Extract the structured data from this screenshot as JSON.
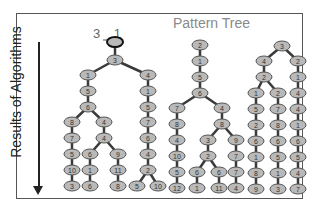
{
  "diagram": {
    "title": "Pattern Tree",
    "axis_label": "Results of Algorithms",
    "root_annotation": "3 1",
    "colors": {
      "node_fill": "#b9b9b9",
      "node_stroke": "#555555",
      "edge": "#3a3a3a",
      "title": "#8a8a8a",
      "frame": "#555555"
    },
    "trees": [
      {
        "name": "left-tree",
        "root": {
          "x": 115,
          "y": 42,
          "label": "",
          "highlight": true
        },
        "nodes": [
          {
            "id": "a0",
            "x": 115,
            "y": 42,
            "label": "",
            "hl": true
          },
          {
            "id": "a1",
            "x": 115,
            "y": 60,
            "label": "3"
          },
          {
            "id": "a2",
            "x": 88,
            "y": 75,
            "label": "1"
          },
          {
            "id": "a3",
            "x": 148,
            "y": 75,
            "label": "4"
          },
          {
            "id": "a4",
            "x": 88,
            "y": 91,
            "label": "5"
          },
          {
            "id": "a5",
            "x": 148,
            "y": 91,
            "label": "1"
          },
          {
            "id": "a6",
            "x": 88,
            "y": 107,
            "label": "6"
          },
          {
            "id": "a7",
            "x": 148,
            "y": 107,
            "label": "5"
          },
          {
            "id": "a8",
            "x": 72,
            "y": 122,
            "label": "8"
          },
          {
            "id": "a9",
            "x": 104,
            "y": 122,
            "label": "4"
          },
          {
            "id": "a10",
            "x": 148,
            "y": 122,
            "label": "7"
          },
          {
            "id": "a11",
            "x": 72,
            "y": 138,
            "label": "7"
          },
          {
            "id": "a12",
            "x": 104,
            "y": 138,
            "label": "4"
          },
          {
            "id": "a13",
            "x": 148,
            "y": 138,
            "label": "6"
          },
          {
            "id": "a14",
            "x": 72,
            "y": 154,
            "label": "5"
          },
          {
            "id": "a15",
            "x": 90,
            "y": 154,
            "label": "6"
          },
          {
            "id": "a16",
            "x": 118,
            "y": 154,
            "label": "9"
          },
          {
            "id": "a17",
            "x": 148,
            "y": 154,
            "label": "4"
          },
          {
            "id": "a18",
            "x": 72,
            "y": 170,
            "label": "10"
          },
          {
            "id": "a19",
            "x": 90,
            "y": 170,
            "label": "1"
          },
          {
            "id": "a20",
            "x": 118,
            "y": 170,
            "label": "11"
          },
          {
            "id": "a21",
            "x": 148,
            "y": 170,
            "label": "2"
          },
          {
            "id": "a22",
            "x": 72,
            "y": 186,
            "label": "3"
          },
          {
            "id": "a23",
            "x": 90,
            "y": 186,
            "label": "6"
          },
          {
            "id": "a24",
            "x": 118,
            "y": 186,
            "label": "8"
          },
          {
            "id": "a25",
            "x": 137,
            "y": 186,
            "label": "5"
          },
          {
            "id": "a26",
            "x": 158,
            "y": 186,
            "label": "10"
          }
        ],
        "edges": [
          [
            "a0",
            "a1"
          ],
          [
            "a1",
            "a2"
          ],
          [
            "a1",
            "a3"
          ],
          [
            "a2",
            "a4"
          ],
          [
            "a4",
            "a6"
          ],
          [
            "a6",
            "a8"
          ],
          [
            "a6",
            "a9"
          ],
          [
            "a8",
            "a11"
          ],
          [
            "a11",
            "a14"
          ],
          [
            "a14",
            "a18"
          ],
          [
            "a18",
            "a22"
          ],
          [
            "a9",
            "a12"
          ],
          [
            "a12",
            "a15"
          ],
          [
            "a12",
            "a16"
          ],
          [
            "a15",
            "a19"
          ],
          [
            "a19",
            "a23"
          ],
          [
            "a16",
            "a20"
          ],
          [
            "a20",
            "a24"
          ],
          [
            "a3",
            "a5"
          ],
          [
            "a5",
            "a7"
          ],
          [
            "a7",
            "a10"
          ],
          [
            "a10",
            "a13"
          ],
          [
            "a13",
            "a17"
          ],
          [
            "a17",
            "a21"
          ],
          [
            "a21",
            "a25"
          ],
          [
            "a21",
            "a26"
          ]
        ]
      },
      {
        "name": "middle-tree",
        "nodes": [
          {
            "id": "b0",
            "x": 200,
            "y": 45,
            "label": "2"
          },
          {
            "id": "b1",
            "x": 200,
            "y": 61,
            "label": "1"
          },
          {
            "id": "b2",
            "x": 200,
            "y": 77,
            "label": "5"
          },
          {
            "id": "b3",
            "x": 200,
            "y": 93,
            "label": "6"
          },
          {
            "id": "b4",
            "x": 177,
            "y": 108,
            "label": "7"
          },
          {
            "id": "b5",
            "x": 222,
            "y": 108,
            "label": "4"
          },
          {
            "id": "b6",
            "x": 177,
            "y": 124,
            "label": "8"
          },
          {
            "id": "b7",
            "x": 222,
            "y": 124,
            "label": "8"
          },
          {
            "id": "b8",
            "x": 177,
            "y": 140,
            "label": "4"
          },
          {
            "id": "b9",
            "x": 208,
            "y": 140,
            "label": "3"
          },
          {
            "id": "b10",
            "x": 236,
            "y": 140,
            "label": "9"
          },
          {
            "id": "b11",
            "x": 177,
            "y": 156,
            "label": "10"
          },
          {
            "id": "b12",
            "x": 208,
            "y": 156,
            "label": "2"
          },
          {
            "id": "b13",
            "x": 236,
            "y": 156,
            "label": "7"
          },
          {
            "id": "b14",
            "x": 177,
            "y": 172,
            "label": "5"
          },
          {
            "id": "b15",
            "x": 197,
            "y": 172,
            "label": "6"
          },
          {
            "id": "b16",
            "x": 219,
            "y": 172,
            "label": "6"
          },
          {
            "id": "b17",
            "x": 236,
            "y": 172,
            "label": "7"
          },
          {
            "id": "b18",
            "x": 177,
            "y": 188,
            "label": "12"
          },
          {
            "id": "b19",
            "x": 197,
            "y": 188,
            "label": "1"
          },
          {
            "id": "b20",
            "x": 219,
            "y": 188,
            "label": "11"
          },
          {
            "id": "b21",
            "x": 236,
            "y": 188,
            "label": "4"
          }
        ],
        "edges": [
          [
            "b0",
            "b1"
          ],
          [
            "b1",
            "b2"
          ],
          [
            "b2",
            "b3"
          ],
          [
            "b3",
            "b4"
          ],
          [
            "b3",
            "b5"
          ],
          [
            "b4",
            "b6"
          ],
          [
            "b6",
            "b8"
          ],
          [
            "b8",
            "b11"
          ],
          [
            "b11",
            "b14"
          ],
          [
            "b14",
            "b18"
          ],
          [
            "b5",
            "b7"
          ],
          [
            "b7",
            "b9"
          ],
          [
            "b7",
            "b10"
          ],
          [
            "b9",
            "b12"
          ],
          [
            "b12",
            "b15"
          ],
          [
            "b12",
            "b16"
          ],
          [
            "b15",
            "b19"
          ],
          [
            "b16",
            "b20"
          ],
          [
            "b10",
            "b13"
          ],
          [
            "b13",
            "b17"
          ],
          [
            "b17",
            "b21"
          ]
        ]
      },
      {
        "name": "right-tree",
        "nodes": [
          {
            "id": "c0",
            "x": 282,
            "y": 46,
            "label": "3"
          },
          {
            "id": "c1",
            "x": 264,
            "y": 61,
            "label": "4"
          },
          {
            "id": "c2",
            "x": 298,
            "y": 61,
            "label": "2"
          },
          {
            "id": "c3",
            "x": 264,
            "y": 77,
            "label": "2"
          },
          {
            "id": "c4",
            "x": 298,
            "y": 77,
            "label": "1"
          },
          {
            "id": "c5",
            "x": 256,
            "y": 93,
            "label": "1"
          },
          {
            "id": "c6",
            "x": 278,
            "y": 93,
            "label": "2"
          },
          {
            "id": "c7",
            "x": 298,
            "y": 93,
            "label": "4"
          },
          {
            "id": "c8",
            "x": 256,
            "y": 109,
            "label": "5"
          },
          {
            "id": "c9",
            "x": 278,
            "y": 109,
            "label": "7"
          },
          {
            "id": "c10",
            "x": 298,
            "y": 109,
            "label": "4"
          },
          {
            "id": "c11",
            "x": 256,
            "y": 125,
            "label": "2"
          },
          {
            "id": "c12",
            "x": 278,
            "y": 125,
            "label": "8"
          },
          {
            "id": "c13",
            "x": 298,
            "y": 125,
            "label": "1"
          },
          {
            "id": "c14",
            "x": 256,
            "y": 141,
            "label": "6"
          },
          {
            "id": "c15",
            "x": 278,
            "y": 141,
            "label": "6"
          },
          {
            "id": "c16",
            "x": 298,
            "y": 141,
            "label": "6"
          },
          {
            "id": "c17",
            "x": 256,
            "y": 157,
            "label": "1"
          },
          {
            "id": "c18",
            "x": 278,
            "y": 157,
            "label": "5"
          },
          {
            "id": "c19",
            "x": 298,
            "y": 157,
            "label": "5"
          },
          {
            "id": "c20",
            "x": 256,
            "y": 173,
            "label": "8"
          },
          {
            "id": "c21",
            "x": 278,
            "y": 173,
            "label": "1"
          },
          {
            "id": "c22",
            "x": 298,
            "y": 173,
            "label": "4"
          },
          {
            "id": "c23",
            "x": 256,
            "y": 189,
            "label": "9"
          },
          {
            "id": "c24",
            "x": 278,
            "y": 189,
            "label": "3"
          },
          {
            "id": "c25",
            "x": 298,
            "y": 189,
            "label": "7"
          }
        ],
        "edges": [
          [
            "c0",
            "c1"
          ],
          [
            "c0",
            "c2"
          ],
          [
            "c1",
            "c3"
          ],
          [
            "c3",
            "c5"
          ],
          [
            "c3",
            "c6"
          ],
          [
            "c5",
            "c8"
          ],
          [
            "c8",
            "c11"
          ],
          [
            "c11",
            "c14"
          ],
          [
            "c14",
            "c17"
          ],
          [
            "c17",
            "c20"
          ],
          [
            "c20",
            "c23"
          ],
          [
            "c6",
            "c9"
          ],
          [
            "c9",
            "c12"
          ],
          [
            "c12",
            "c15"
          ],
          [
            "c15",
            "c18"
          ],
          [
            "c18",
            "c21"
          ],
          [
            "c21",
            "c24"
          ],
          [
            "c2",
            "c4"
          ],
          [
            "c4",
            "c7"
          ],
          [
            "c7",
            "c10"
          ],
          [
            "c10",
            "c13"
          ],
          [
            "c13",
            "c16"
          ],
          [
            "c16",
            "c19"
          ],
          [
            "c19",
            "c22"
          ],
          [
            "c22",
            "c25"
          ]
        ]
      }
    ]
  }
}
